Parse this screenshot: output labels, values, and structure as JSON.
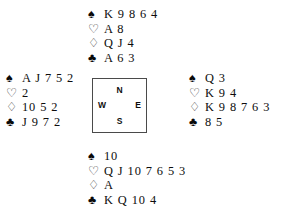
{
  "diagram": {
    "type": "bridge-deal",
    "suit_glyphs": {
      "spades": "♠",
      "hearts": "♡",
      "diamonds": "♢",
      "clubs": "♣"
    },
    "suit_order": [
      "spades",
      "hearts",
      "diamonds",
      "clubs"
    ],
    "colors": {
      "ink": "#0d0d0d",
      "box_border": "#4a4a4a",
      "background": "#ffffff"
    },
    "compass": {
      "north_label": "N",
      "west_label": "W",
      "east_label": "E",
      "south_label": "S"
    },
    "hands": {
      "north": {
        "seat": "North",
        "spades_symbol": "♠",
        "hearts_symbol": "♡",
        "diamonds_symbol": "♢",
        "clubs_symbol": "♣",
        "spades": "K 9 8 6 4",
        "hearts": "A 8",
        "diamonds": "Q J 4",
        "clubs": "A 6 3"
      },
      "west": {
        "seat": "West",
        "spades_symbol": "♠",
        "hearts_symbol": "♡",
        "diamonds_symbol": "♢",
        "clubs_symbol": "♣",
        "spades": "A J 7 5 2",
        "hearts": "2",
        "diamonds": "10 5 2",
        "clubs": "J 9 7 2"
      },
      "east": {
        "seat": "East",
        "spades_symbol": "♠",
        "hearts_symbol": "♡",
        "diamonds_symbol": "♢",
        "clubs_symbol": "♣",
        "spades": "Q 3",
        "hearts": "K 9 4",
        "diamonds": "K 9 8 7 6 3",
        "clubs": "8 5"
      },
      "south": {
        "seat": "South",
        "spades_symbol": "♠",
        "hearts_symbol": "♡",
        "diamonds_symbol": "♢",
        "clubs_symbol": "♣",
        "spades": "10",
        "hearts": "Q J 10 7 6 5 3",
        "diamonds": "A",
        "clubs": "K Q 10 4"
      }
    }
  }
}
